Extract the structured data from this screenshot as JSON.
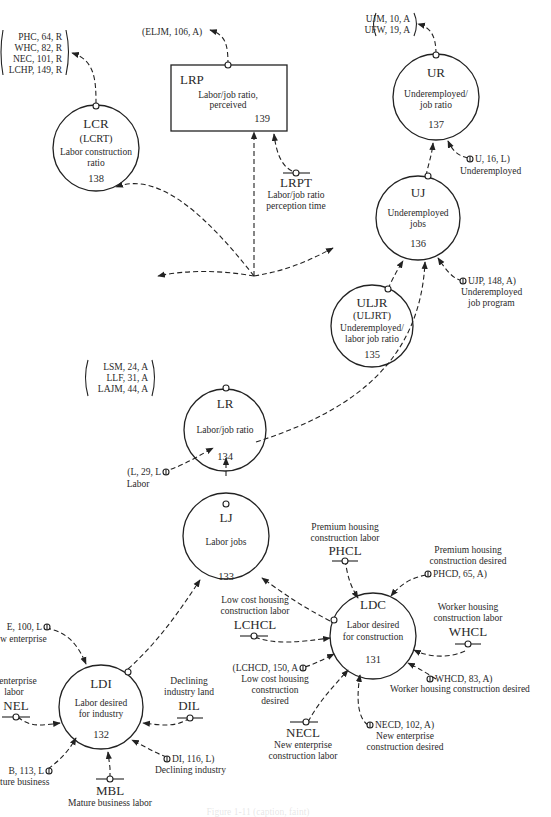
{
  "figure": {
    "caption": "Figure 1-11 (caption, faint)"
  },
  "nodes": {
    "lcr": {
      "code": "LCR",
      "sub": "(LCRT)",
      "line1": "Labor construction",
      "line2": "ratio",
      "num": "138"
    },
    "lrp": {
      "code": "LRP",
      "line1": "Labor/job ratio,",
      "line2": "perceived",
      "num": "139"
    },
    "ur": {
      "code": "UR",
      "line1": "Underemployed/",
      "line2": "job ratio",
      "num": "137"
    },
    "uj": {
      "code": "UJ",
      "line1": "Underemployed",
      "line2": "jobs",
      "num": "136"
    },
    "uljr": {
      "code": "ULJR",
      "sub": "(ULJRT)",
      "line1": "Underemployed/",
      "line2": "labor job ratio",
      "num": "135"
    },
    "lr": {
      "code": "LR",
      "line1": "Labor/job ratio",
      "num": "134"
    },
    "lj": {
      "code": "LJ",
      "line1": "Labor jobs",
      "num": "133"
    },
    "ldc": {
      "code": "LDC",
      "line1": "Labor desired",
      "line2": "for construction",
      "num": "131"
    },
    "ldi": {
      "code": "LDI",
      "line1": "Labor desired",
      "line2": "for industry",
      "num": "132"
    }
  },
  "external_refs": {
    "lcr_out": [
      "PHC, 64, R",
      "WHC, 82, R",
      "NEC, 101, R",
      "LCHP, 149, R"
    ],
    "lrp_out": "(ELJM, 106, A)",
    "ur_out": [
      "UJM, 10, A",
      "UFW, 19, A"
    ],
    "ur_in": {
      "ref": "U, 16, L)",
      "label": "Underemployed"
    },
    "uj_in": {
      "ref": "UJP, 148, A)",
      "label1": "Underemployed",
      "label2": "job program"
    },
    "lr_out": [
      "LSM, 24, A",
      "LLF, 31, A",
      "LAJM, 44, A"
    ],
    "lr_in": {
      "ref": "(L, 29, L",
      "label": "Labor"
    },
    "ldc_phcd": {
      "label1": "Premium housing",
      "label2": "construction desired",
      "ref": "PHCD, 65, A)"
    },
    "ldc_whcd": {
      "ref": "WHCD, 83, A)",
      "label": "Worker housing construction desired"
    },
    "ldc_necd": {
      "ref": "NECD, 102, A)",
      "label1": "New enterprise",
      "label2": "construction desired"
    },
    "ldc_lchcd": {
      "ref": "(LCHCD, 150, A",
      "label1": "Low cost housing",
      "label2": "construction",
      "label3": "desired"
    },
    "ldi_ne": {
      "ref": "E, 100, L",
      "label": "w enterprise"
    },
    "ldi_mb": {
      "ref": "B, 113, L",
      "label": "ture business"
    },
    "ldi_di": {
      "ref": "DI, 116, L)",
      "label": "Declining industry"
    }
  },
  "constants": {
    "lrpt": {
      "code": "LRPT",
      "label1": "Labor/job ratio",
      "label2": "perception time"
    },
    "phcl": {
      "code": "PHCL",
      "label1": "Premium housing",
      "label2": "construction labor"
    },
    "lchcl": {
      "code": "LCHCL",
      "label1": "Low cost housing",
      "label2": "construction labor"
    },
    "whcl": {
      "code": "WHCL",
      "label1": "Worker housing",
      "label2": "construction labor"
    },
    "necl": {
      "code": "NECL",
      "label1": "New enterprise",
      "label2": "construction labor"
    },
    "nel": {
      "code": "NEL",
      "label1": "enterprise",
      "label2": "labor"
    },
    "dil": {
      "code": "DIL",
      "label1": "Declining",
      "label2": "industry land"
    },
    "mbl": {
      "code": "MBL",
      "label1": "Mature business labor"
    }
  }
}
